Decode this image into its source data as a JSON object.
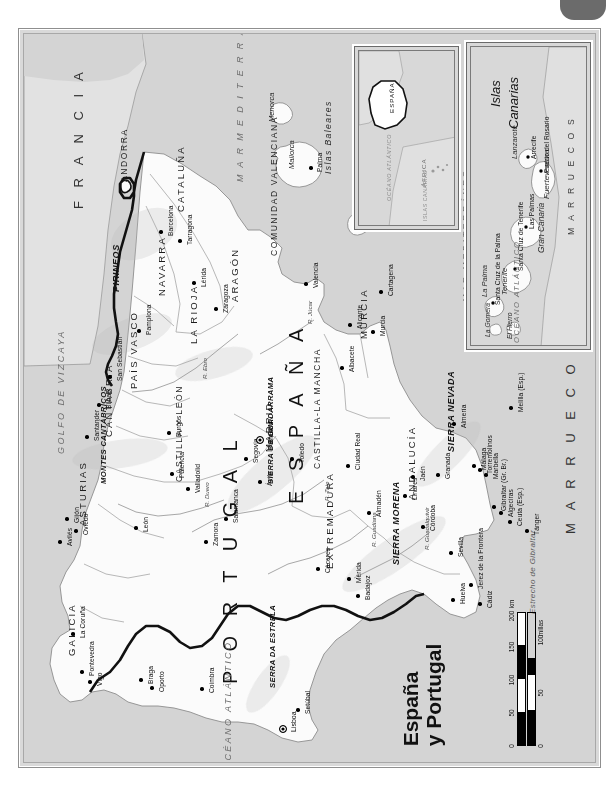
{
  "map": {
    "title_line1": "España",
    "title_line2": "y Portugal",
    "scale": {
      "km_ticks": [
        "0",
        "50",
        "100",
        "150",
        "200"
      ],
      "km_unit": "km",
      "mi_ticks": [
        "0",
        "50",
        "100"
      ],
      "mi_unit": "millas"
    },
    "countries": [
      {
        "name": "E S P A Ñ A",
        "x": 262,
        "y": 470
      },
      {
        "name": "P O R T U G A L",
        "x": 196,
        "y": 650
      },
      {
        "name": "F R A N C I A",
        "x": 48,
        "y": 175
      },
      {
        "name": "M A R R U E C O S",
        "x": 540,
        "y": 500
      },
      {
        "name": "ANDORRA",
        "x": 96,
        "y": 148
      }
    ],
    "regions": [
      {
        "name": "CATALUÑA",
        "x": 152,
        "y": 178
      },
      {
        "name": "ARAGÓN",
        "x": 206,
        "y": 268
      },
      {
        "name": "NAVARRA",
        "x": 133,
        "y": 262
      },
      {
        "name": "LA RIOJA",
        "x": 165,
        "y": 310
      },
      {
        "name": "PAÍS VASCO",
        "x": 105,
        "y": 355
      },
      {
        "name": "CANTABRIA",
        "x": 80,
        "y": 403
      },
      {
        "name": "ASTURIAS",
        "x": 54,
        "y": 492
      },
      {
        "name": "GALICIA",
        "x": 43,
        "y": 622
      },
      {
        "name": "CASTILLA Y LEÓN",
        "x": 151,
        "y": 448
      },
      {
        "name": "MADRID",
        "x": 240,
        "y": 418
      },
      {
        "name": "EXTREMADURA",
        "x": 301,
        "y": 535
      },
      {
        "name": "CASTILLA-LA MANCHA",
        "x": 289,
        "y": 435
      },
      {
        "name": "COMUNIDAD VALENCIANA",
        "x": 246,
        "y": 222
      },
      {
        "name": "MURCIA",
        "x": 335,
        "y": 305
      },
      {
        "name": "ANDALUCÍA",
        "x": 383,
        "y": 466
      }
    ],
    "ranges": [
      {
        "name": "PIRINEOS",
        "x": 88,
        "y": 258
      },
      {
        "name": "MONTES CANTÁBRICOS",
        "x": 76,
        "y": 450
      },
      {
        "name": "SIERRA DE GUADARRAMA",
        "x": 243,
        "y": 450
      },
      {
        "name": "SIERRA MORENA",
        "x": 368,
        "y": 531
      },
      {
        "name": "SIERRA NEVADA",
        "x": 423,
        "y": 418
      },
      {
        "name": "SERRA DA ESTRELA",
        "x": 245,
        "y": 654
      }
    ],
    "waters": [
      {
        "name": "OCÉANO  ATLÁNTICO",
        "x": 200,
        "y": 736
      },
      {
        "name": "M A R   M E D I T E R R Á N E O",
        "x": 212,
        "y": 148
      },
      {
        "name": "MAR MEDITERRÁNEO",
        "x": 438,
        "y": 268
      },
      {
        "name": "GOLFO DE VIZCAYA",
        "x": 33,
        "y": 420
      },
      {
        "name": "OCÉANO ATLÁNTICO",
        "x": 541,
        "y": 310
      },
      {
        "name": "Estrecho de Gibraltar",
        "x": 505,
        "y": 580
      }
    ],
    "rivers": [
      {
        "name": "R. Ebro",
        "x": 178,
        "y": 345
      },
      {
        "name": "R. Duero",
        "x": 180,
        "y": 473
      },
      {
        "name": "R. Tajo",
        "x": 300,
        "y": 467
      },
      {
        "name": "R. Guadiana",
        "x": 347,
        "y": 513
      },
      {
        "name": "R. Guadalquivir",
        "x": 400,
        "y": 516
      },
      {
        "name": "R. Júcar",
        "x": 283,
        "y": 290
      }
    ],
    "cities": [
      {
        "name": "Barcelona",
        "x": 137,
        "y": 198,
        "dx": 7,
        "dy": 4
      },
      {
        "name": "Tarragona",
        "x": 156,
        "y": 207,
        "dx": 7,
        "dy": 4
      },
      {
        "name": "Lérida",
        "x": 170,
        "y": 249,
        "dx": 7,
        "dy": 4
      },
      {
        "name": "Zaragoza",
        "x": 192,
        "y": 275,
        "dx": 7,
        "dy": 4
      },
      {
        "name": "Pamplona",
        "x": 115,
        "y": 297,
        "dx": 7,
        "dy": 4
      },
      {
        "name": "San Sebastián",
        "x": 86,
        "y": 343,
        "dx": 7,
        "dy": 4
      },
      {
        "name": "Bilbao",
        "x": 75,
        "y": 371,
        "dx": 7,
        "dy": 4
      },
      {
        "name": "Santander",
        "x": 63,
        "y": 403,
        "dx": 7,
        "dy": 4
      },
      {
        "name": "Gijón",
        "x": 43,
        "y": 485,
        "dx": 7,
        "dy": 4
      },
      {
        "name": "Oviedo",
        "x": 52,
        "y": 497,
        "dx": 7,
        "dy": 4
      },
      {
        "name": "Avilés",
        "x": 36,
        "y": 508,
        "dx": 7,
        "dy": 4
      },
      {
        "name": "Burgos",
        "x": 145,
        "y": 399,
        "dx": 7,
        "dy": 4
      },
      {
        "name": "Palencia",
        "x": 148,
        "y": 440,
        "dx": 7,
        "dy": 4
      },
      {
        "name": "Valladolid",
        "x": 164,
        "y": 455,
        "dx": 7,
        "dy": 4
      },
      {
        "name": "León",
        "x": 112,
        "y": 494,
        "dx": 7,
        "dy": 4
      },
      {
        "name": "Zamora",
        "x": 182,
        "y": 508,
        "dx": 7,
        "dy": 4
      },
      {
        "name": "Salamanca",
        "x": 202,
        "y": 485,
        "dx": 7,
        "dy": 4
      },
      {
        "name": "Segovia",
        "x": 222,
        "y": 425,
        "dx": 7,
        "dy": 4
      },
      {
        "name": "Ávila",
        "x": 236,
        "y": 448,
        "dx": 7,
        "dy": 4
      },
      {
        "name": "Madrid",
        "x": 235,
        "y": 405,
        "dx": 8,
        "dy": 4
      },
      {
        "name": "Toledo",
        "x": 268,
        "y": 425,
        "dx": 7,
        "dy": 4
      },
      {
        "name": "Cáceres",
        "x": 294,
        "y": 535,
        "dx": 7,
        "dy": 4
      },
      {
        "name": "Mérida",
        "x": 325,
        "y": 545,
        "dx": 7,
        "dy": 4
      },
      {
        "name": "Badajoz",
        "x": 334,
        "y": 562,
        "dx": 7,
        "dy": 4
      },
      {
        "name": "Ciudad Real",
        "x": 324,
        "y": 432,
        "dx": 7,
        "dy": 4
      },
      {
        "name": "Almadén",
        "x": 345,
        "y": 479,
        "dx": 7,
        "dy": 4
      },
      {
        "name": "Albacete",
        "x": 318,
        "y": 334,
        "dx": 7,
        "dy": 4
      },
      {
        "name": "Valencia",
        "x": 282,
        "y": 250,
        "dx": 7,
        "dy": 4
      },
      {
        "name": "Alicante",
        "x": 326,
        "y": 291,
        "dx": 7,
        "dy": 4
      },
      {
        "name": "Murcia",
        "x": 349,
        "y": 298,
        "dx": 7,
        "dy": 4
      },
      {
        "name": "Cartagena",
        "x": 357,
        "y": 258,
        "dx": 7,
        "dy": 4
      },
      {
        "name": "Linares",
        "x": 381,
        "y": 462,
        "dx": 7,
        "dy": 4
      },
      {
        "name": "Jaén",
        "x": 389,
        "y": 443,
        "dx": 7,
        "dy": 4
      },
      {
        "name": "Córdoba",
        "x": 399,
        "y": 493,
        "dx": 7,
        "dy": 4
      },
      {
        "name": "Granada",
        "x": 414,
        "y": 441,
        "dx": 7,
        "dy": 4
      },
      {
        "name": "Almería",
        "x": 430,
        "y": 390,
        "dx": 7,
        "dy": 4
      },
      {
        "name": "Sevilla",
        "x": 427,
        "y": 519,
        "dx": 7,
        "dy": 4
      },
      {
        "name": "Huelva",
        "x": 429,
        "y": 566,
        "dx": 7,
        "dy": 4
      },
      {
        "name": "Cádiz",
        "x": 456,
        "y": 570,
        "dx": 7,
        "dy": 4
      },
      {
        "name": "Jerez de la Frontera",
        "x": 447,
        "y": 551,
        "dx": 7,
        "dy": 4
      },
      {
        "name": "Málaga",
        "x": 450,
        "y": 432,
        "dx": 7,
        "dy": 4
      },
      {
        "name": "Torremolinos",
        "x": 456,
        "y": 436,
        "dx": 7,
        "dy": 4
      },
      {
        "name": "Marbella",
        "x": 462,
        "y": 441,
        "dx": 7,
        "dy": 4
      },
      {
        "name": "Gibraltar (Gr. Br.)",
        "x": 470,
        "y": 473,
        "dx": 7,
        "dy": 4
      },
      {
        "name": "Algeciras",
        "x": 477,
        "y": 479,
        "dx": 7,
        "dy": 4
      },
      {
        "name": "Ceuta (Esp.)",
        "x": 486,
        "y": 488,
        "dx": 7,
        "dy": 4
      },
      {
        "name": "Tánger",
        "x": 503,
        "y": 497,
        "dx": 7,
        "dy": 4
      },
      {
        "name": "Melilla (Esp.)",
        "x": 487,
        "y": 374,
        "dx": 7,
        "dy": 4
      },
      {
        "name": "La Coruña",
        "x": 49,
        "y": 600,
        "dx": 7,
        "dy": 4
      },
      {
        "name": "Pontevedra",
        "x": 58,
        "y": 638,
        "dx": 7,
        "dy": 4
      },
      {
        "name": "Vigo",
        "x": 66,
        "y": 648,
        "dx": 7,
        "dy": 4
      },
      {
        "name": "Braga",
        "x": 117,
        "y": 646,
        "dx": 7,
        "dy": 4
      },
      {
        "name": "Oporto",
        "x": 128,
        "y": 654,
        "dx": 7,
        "dy": 4
      },
      {
        "name": "Coimbra",
        "x": 178,
        "y": 655,
        "dx": 7,
        "dy": 4
      },
      {
        "name": "Lisboa",
        "x": 258,
        "y": 694,
        "dx": 8,
        "dy": 4
      },
      {
        "name": "Setúbal",
        "x": 274,
        "y": 676,
        "dx": 7,
        "dy": 4
      }
    ],
    "capitals": [
      "Madrid",
      "Lisboa"
    ],
    "islands": {
      "group_label": "Islas Baleares",
      "items": [
        {
          "name": "Menorca",
          "x": 244,
          "y": 88
        },
        {
          "name": "Mallorca",
          "x": 264,
          "y": 135
        },
        {
          "name": "Ibiza",
          "x": 331,
          "y": 166
        },
        {
          "name": "Formentera",
          "x": 345,
          "y": 195
        },
        {
          "name": "Palma",
          "x": 287,
          "y": 134
        }
      ]
    },
    "inset_locator": {
      "labels": [
        "ESPAÑA",
        "ÁFRICA",
        "OCÉANO ATLÁNTICO",
        "ISLAS CANARIAS"
      ]
    },
    "inset_canarias": {
      "title_line1": "Islas",
      "title_line2": "Canarias",
      "ocean": "OCÉANO ATLÁNTICO",
      "neighbor": "M A R R U E C O S",
      "islands": [
        "La Palma",
        "La Gomera",
        "El Hierro",
        "Tenerife",
        "Gran Canaria",
        "Fuerteventura",
        "Lanzarote"
      ],
      "cities": [
        "Santa Cruz de la Palma",
        "Santa Cruz de Tenerife",
        "Las Palmas",
        "Puerto del Rosario",
        "Arrecife"
      ]
    },
    "colors": {
      "sea": "#d4d4d4",
      "land": "#fbfbfb",
      "border": "#111111",
      "page": "#ffffff"
    }
  }
}
